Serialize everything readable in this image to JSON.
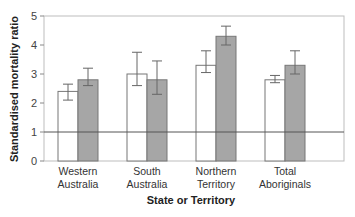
{
  "chart_data": {
    "type": "bar",
    "title": "",
    "xlabel": "State or Territory",
    "ylabel": "Standardised mortality ratio",
    "ylim": [
      0,
      5
    ],
    "yticks": [
      0,
      1,
      2,
      3,
      4,
      5
    ],
    "grid": false,
    "reference_line": 1,
    "legend": null,
    "categories": [
      [
        "Western",
        "Australia"
      ],
      [
        "South",
        "Australia"
      ],
      [
        "Northern",
        "Territory"
      ],
      [
        "Total",
        "Aboriginals"
      ]
    ],
    "series": [
      {
        "name": "series-1 (white)",
        "color": "#ffffff",
        "values": [
          2.4,
          3.0,
          3.3,
          2.8
        ],
        "error_low": [
          2.1,
          2.6,
          3.05,
          2.7
        ],
        "error_high": [
          2.65,
          3.75,
          3.8,
          2.95
        ]
      },
      {
        "name": "series-2 (grey)",
        "color": "#a6a6a6",
        "values": [
          2.8,
          2.8,
          4.3,
          3.3
        ],
        "error_low": [
          2.6,
          2.3,
          4.0,
          3.0
        ],
        "error_high": [
          3.2,
          3.45,
          4.65,
          3.8
        ]
      }
    ]
  },
  "labels": {
    "ylabel": "Standardised mortality ratio",
    "xlabel": "State or Territory",
    "cat0_l1": "Western",
    "cat0_l2": "Australia",
    "cat1_l1": "South",
    "cat1_l2": "Australia",
    "cat2_l1": "Northern",
    "cat2_l2": "Territory",
    "cat3_l1": "Total",
    "cat3_l2": "Aboriginals",
    "y0": "0",
    "y1": "1",
    "y2": "2",
    "y3": "3",
    "y4": "4",
    "y5": "5"
  }
}
